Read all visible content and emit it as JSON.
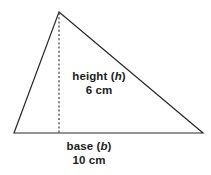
{
  "figure": {
    "background_color": "#ffffff",
    "stroke_color": "#2a2a2a",
    "text_color": "#1c1c1c"
  },
  "shape": {
    "type": "triangle",
    "apex": {
      "x": 59,
      "y": 12
    },
    "bottom_left": {
      "x": 14,
      "y": 133
    },
    "bottom_right": {
      "x": 203,
      "y": 133
    },
    "altitude": {
      "style": "dashed",
      "from": {
        "x": 59,
        "y": 12
      },
      "to": {
        "x": 59,
        "y": 133
      }
    }
  },
  "labels": {
    "height": {
      "name_text": "height (",
      "variable": "h",
      "name_close": ")",
      "value_text": "6 cm",
      "value_number": "6",
      "unit": "cm"
    },
    "base": {
      "name_text": "base (",
      "variable": "b",
      "name_close": ")",
      "value_text": "10 cm",
      "value_number": "10",
      "unit": "cm"
    }
  }
}
